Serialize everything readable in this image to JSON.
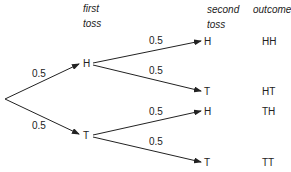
{
  "headers": {
    "first_toss_1": "first",
    "first_toss_2": "toss",
    "second_toss_1": "second",
    "second_toss_2": "toss",
    "outcome": "outcome"
  },
  "first_level": {
    "upper": {
      "node": "H",
      "prob": "0.5"
    },
    "lower": {
      "node": "T",
      "prob": "0.5"
    }
  },
  "second_level": [
    {
      "node": "H",
      "prob": "0.5",
      "outcome": "HH"
    },
    {
      "node": "T",
      "prob": "0.5",
      "outcome": "HT"
    },
    {
      "node": "H",
      "prob": "0.5",
      "outcome": "TH"
    },
    {
      "node": "T",
      "prob": "0.5",
      "outcome": "TT"
    }
  ],
  "colors": {
    "line": "#222222",
    "text": "#222222"
  }
}
